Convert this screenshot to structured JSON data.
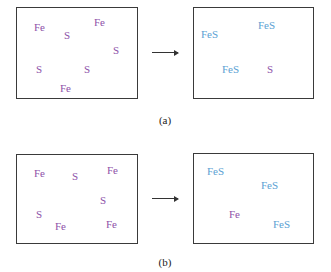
{
  "panels": [
    {
      "caption": "(a)",
      "before": {
        "atoms": [
          {
            "label": "Fe",
            "type": "reactant",
            "x": 34,
            "y": 22
          },
          {
            "label": "S",
            "type": "reactant",
            "x": 64,
            "y": 30
          },
          {
            "label": "Fe",
            "type": "reactant",
            "x": 94,
            "y": 17
          },
          {
            "label": "S",
            "type": "reactant",
            "x": 113,
            "y": 45
          },
          {
            "label": "S",
            "type": "reactant",
            "x": 36,
            "y": 64
          },
          {
            "label": "S",
            "type": "reactant",
            "x": 84,
            "y": 64
          },
          {
            "label": "Fe",
            "type": "reactant",
            "x": 60,
            "y": 83
          }
        ]
      },
      "after": {
        "atoms": [
          {
            "label": "FeS",
            "type": "product",
            "x": 201,
            "y": 29
          },
          {
            "label": "FeS",
            "type": "product",
            "x": 258,
            "y": 20
          },
          {
            "label": "FeS",
            "type": "product",
            "x": 222,
            "y": 64
          },
          {
            "label": "S",
            "type": "reactant",
            "x": 267,
            "y": 64
          }
        ]
      }
    },
    {
      "caption": "(b)",
      "before": {
        "atoms": [
          {
            "label": "Fe",
            "type": "reactant",
            "x": 34,
            "y": 168
          },
          {
            "label": "S",
            "type": "reactant",
            "x": 72,
            "y": 171
          },
          {
            "label": "Fe",
            "type": "reactant",
            "x": 107,
            "y": 165
          },
          {
            "label": "S",
            "type": "reactant",
            "x": 100,
            "y": 195
          },
          {
            "label": "S",
            "type": "reactant",
            "x": 36,
            "y": 209
          },
          {
            "label": "Fe",
            "type": "reactant",
            "x": 55,
            "y": 221
          },
          {
            "label": "Fe",
            "type": "reactant",
            "x": 106,
            "y": 219
          }
        ]
      },
      "after": {
        "atoms": [
          {
            "label": "FeS",
            "type": "product",
            "x": 207,
            "y": 166
          },
          {
            "label": "FeS",
            "type": "product",
            "x": 261,
            "y": 180
          },
          {
            "label": "Fe",
            "type": "reactant",
            "x": 229,
            "y": 209
          },
          {
            "label": "FeS",
            "type": "product",
            "x": 273,
            "y": 219
          }
        ]
      }
    }
  ],
  "colors": {
    "reactant": "#8e52a8",
    "product": "#5b9fd3",
    "border": "#3a3a3a"
  }
}
